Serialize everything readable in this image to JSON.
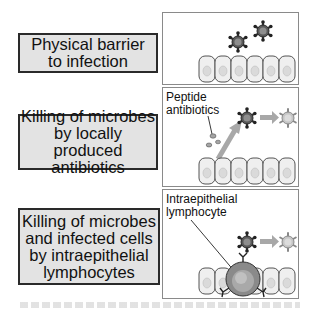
{
  "colors": {
    "label_fill": "#e3e3e3",
    "label_border": "#2a2a2a",
    "panel_border": "#8a8a8a",
    "microbe_live": "#555555",
    "microbe_dead": "#b0b0b0",
    "arrow": "#a8a8a8",
    "cell_fill": "#ececec"
  },
  "rows": [
    {
      "label_lines": [
        "Physical barrier",
        "to infection"
      ],
      "panel": {
        "annotation": [],
        "icons": [
          "microbe-icon",
          "microbe-icon",
          "epithelial-cells-icon"
        ]
      }
    },
    {
      "label_lines": [
        "Killing of microbes",
        "by locally produced",
        "antibiotics"
      ],
      "panel": {
        "annotation": [
          "Peptide",
          "antibiotics"
        ],
        "icons": [
          "peptide-icon",
          "arrow-icon",
          "microbe-icon",
          "arrow-icon",
          "dead-microbe-icon",
          "epithelial-cells-icon"
        ]
      }
    },
    {
      "label_lines": [
        "Killing of microbes",
        "and infected cells",
        "by intraepithelial",
        "lymphocytes"
      ],
      "panel": {
        "annotation": [
          "Intraepithelial",
          "lymphocyte"
        ],
        "icons": [
          "microbe-icon",
          "arrow-icon",
          "dead-microbe-icon",
          "lymphocyte-icon",
          "epithelial-cells-icon"
        ]
      }
    }
  ]
}
